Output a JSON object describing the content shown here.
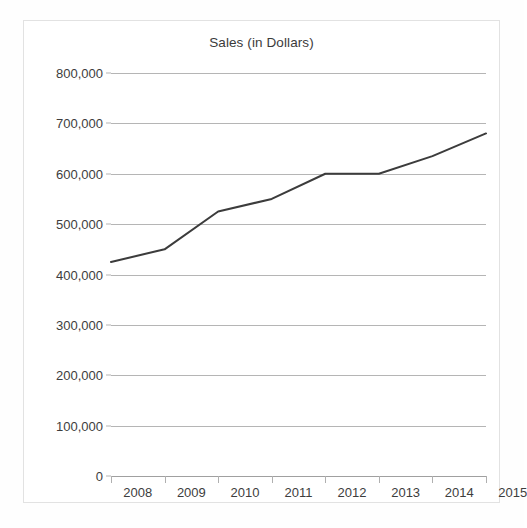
{
  "chart_data": {
    "type": "line",
    "title": "Sales (in Dollars)",
    "xlabel": "",
    "ylabel": "",
    "categories": [
      "2008",
      "2009",
      "2010",
      "2011",
      "2012",
      "2013",
      "2014",
      "2015"
    ],
    "values": [
      425000,
      450000,
      525000,
      550000,
      600000,
      600000,
      635000,
      680000
    ],
    "series": [
      {
        "name": "Sales",
        "values": [
          425000,
          450000,
          525000,
          550000,
          600000,
          600000,
          635000,
          680000
        ]
      }
    ],
    "ylim": [
      0,
      800000
    ],
    "y_ticks": [
      0,
      100000,
      200000,
      300000,
      400000,
      500000,
      600000,
      700000,
      800000
    ],
    "y_tick_labels": [
      "0",
      "100,000",
      "200,000",
      "300,000",
      "400,000",
      "500,000",
      "600,000",
      "700,000",
      "800,000"
    ],
    "grid": true,
    "legend": false,
    "legend_position": "none",
    "line_color": "#3c3c3c",
    "gridline_color": "#b5b5b5",
    "background_color": "#ffffff"
  }
}
